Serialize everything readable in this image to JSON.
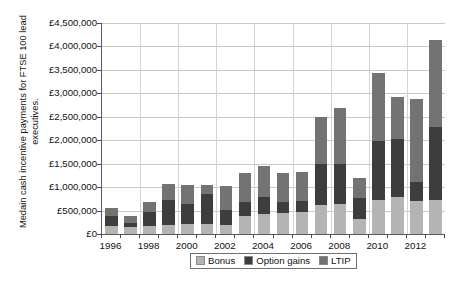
{
  "axis": {
    "y_title": "Medain cash incentive payments for FTSE 100 lead executives.",
    "y_ticks": [
      "£0",
      "£500,000",
      "£1,000,000",
      "£1,500,000",
      "£2,000,000",
      "£2,500,000",
      "£3,000,000",
      "£3,500,000",
      "£4,000,000",
      "£4,500,000"
    ],
    "x_labels": [
      "1996",
      "1998",
      "2000",
      "2002",
      "2004",
      "2006",
      "2008",
      "2010",
      "2012"
    ]
  },
  "legend": {
    "items": [
      {
        "label": "Bonus",
        "color": "#b4b4b4"
      },
      {
        "label": "Option gains",
        "color": "#3d3d3d"
      },
      {
        "label": "LTIP",
        "color": "#737373"
      }
    ]
  },
  "chart_data": {
    "type": "bar",
    "stacked": true,
    "title": "",
    "xlabel": "",
    "ylabel": "Medain cash incentive payments for FTSE 100 lead executives.",
    "ylim": [
      0,
      4500000
    ],
    "ytick_interval": 500000,
    "grid": true,
    "legend_position": "bottom",
    "categories": [
      "1996",
      "1997",
      "1998",
      "1999",
      "2000",
      "2001",
      "2002",
      "2003",
      "2004",
      "2005",
      "2006",
      "2007",
      "2008",
      "2009",
      "2010",
      "2011",
      "2012",
      "2013"
    ],
    "series": [
      {
        "name": "Bonus",
        "color": "#b4b4b4",
        "values": [
          175000,
          150000,
          180000,
          200000,
          205000,
          205000,
          200000,
          380000,
          420000,
          440000,
          460000,
          620000,
          630000,
          330000,
          730000,
          790000,
          700000,
          720000
        ]
      },
      {
        "name": "Option gains",
        "color": "#3d3d3d",
        "values": [
          215000,
          75000,
          300000,
          520000,
          430000,
          650000,
          310000,
          300000,
          370000,
          250000,
          250000,
          870000,
          870000,
          440000,
          1250000,
          1230000,
          420000,
          1560000
        ]
      },
      {
        "name": "LTIP",
        "color": "#737373",
        "values": [
          160000,
          160000,
          200000,
          340000,
          400000,
          200000,
          520000,
          620000,
          660000,
          620000,
          620000,
          1010000,
          1180000,
          430000,
          1460000,
          910000,
          1760000,
          1860000
        ]
      }
    ]
  }
}
